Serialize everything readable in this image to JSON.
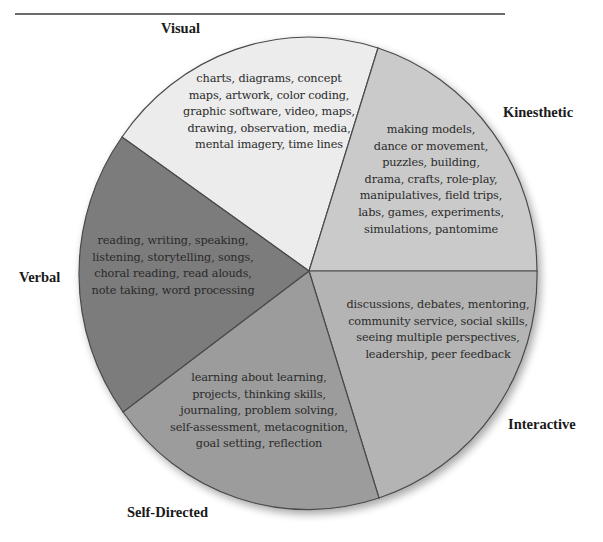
{
  "diagram": {
    "type": "pie",
    "segments": [
      {
        "id": "visual",
        "label": "Visual",
        "color": "#ececec",
        "lines": [
          "charts, diagrams, concept",
          "maps, artwork, color coding,",
          "graphic software, video, maps,",
          "drawing, observation, media,",
          "mental imagery, time lines"
        ]
      },
      {
        "id": "kinesthetic",
        "label": "Kinesthetic",
        "color": "#cacaca",
        "lines": [
          "making models,",
          "dance or movement,",
          "puzzles, building,",
          "drama, crafts, role-play,",
          "manipulatives, field trips,",
          "labs, games, experiments,",
          "simulations, pantomime"
        ]
      },
      {
        "id": "interactive",
        "label": "Interactive",
        "color": "#b4b4b4",
        "lines": [
          "discussions, debates, mentoring,",
          "community service, social skills,",
          "seeing multiple perspectives,",
          "leadership, peer feedback"
        ]
      },
      {
        "id": "self-directed",
        "label": "Self-Directed",
        "color": "#9c9c9c",
        "lines": [
          "learning about learning,",
          "projects, thinking skills,",
          "journaling, problem solving,",
          "self-assessment, metacognition,",
          "goal setting, reflection"
        ]
      },
      {
        "id": "verbal",
        "label": "Verbal",
        "color": "#7b7b7b",
        "lines": [
          "reading, writing, speaking,",
          "listening, storytelling, songs,",
          "choral reading, read alouds,",
          "note taking, word processing"
        ]
      }
    ],
    "border_color": "#4a4a4a"
  }
}
